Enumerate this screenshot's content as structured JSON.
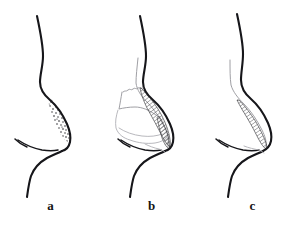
{
  "figure": {
    "type": "anatomical-line-diagram",
    "background_color": "#ffffff",
    "ink_color": "#16161a",
    "secondary_ink_color": "#9a9a9f",
    "panel_count": 3
  },
  "panels": [
    {
      "id": "a",
      "label": "a",
      "caption_position": "below",
      "description": "lateral nasal profile with stippled dorsal hump region",
      "markings": [
        "stipple",
        "profile-outline",
        "nostril",
        "upper-lip",
        "chin"
      ],
      "shading_style": "stipple"
    },
    {
      "id": "b",
      "label": "b",
      "caption_position": "below",
      "description": "lateral nasal profile with internal cartilage outlines and diagonally hatched dorsal resection area",
      "markings": [
        "hatching",
        "cartilage-outline",
        "septum-outline",
        "profile-outline",
        "nostril",
        "upper-lip",
        "chin"
      ],
      "shading_style": "diagonal-hatch"
    },
    {
      "id": "c",
      "label": "c",
      "caption_position": "below",
      "description": "lateral nasal profile post-reduction with narrow hatched sliver and ghost pre-operative line",
      "markings": [
        "hatching",
        "ghost-profile-line",
        "profile-outline",
        "nostril",
        "upper-lip",
        "chin"
      ],
      "shading_style": "diagonal-hatch"
    }
  ],
  "colors": {
    "background": "#ffffff",
    "primary_stroke": "#16161a",
    "secondary_stroke": "#9a9a9f",
    "hatch_stroke": "#2a2a2e",
    "label_text": "#141414"
  }
}
